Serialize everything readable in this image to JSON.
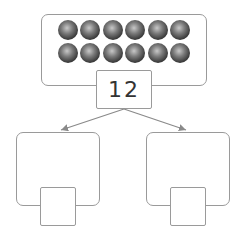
{
  "diagram": {
    "type": "number-bond",
    "whole": {
      "value": "12",
      "counters": 12,
      "rows": 2,
      "per_row": 6
    },
    "parts": [
      {
        "position": "left",
        "value": ""
      },
      {
        "position": "right",
        "value": ""
      }
    ],
    "colors": {
      "stroke": "#9a9a9a",
      "counter": "#3a3a3a",
      "arrow": "#8a8a8a"
    }
  }
}
